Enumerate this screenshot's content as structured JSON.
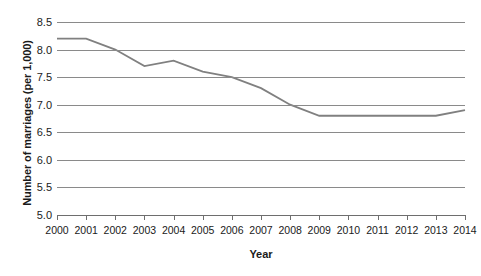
{
  "chart_data": {
    "type": "line",
    "title": "",
    "xlabel": "Year",
    "ylabel": "Number of marriages (per 1,000)",
    "categories": [
      "2000",
      "2001",
      "2002",
      "2003",
      "2004",
      "2005",
      "2006",
      "2007",
      "2008",
      "2009",
      "2010",
      "2011",
      "2012",
      "2013",
      "2014"
    ],
    "values": [
      8.2,
      8.2,
      8.0,
      7.7,
      7.8,
      7.6,
      7.5,
      7.3,
      7.0,
      6.8,
      6.8,
      6.8,
      6.8,
      6.8,
      6.9
    ],
    "series": [
      {
        "name": "Number of marriages (per 1,000)",
        "values": [
          8.2,
          8.2,
          8.0,
          7.7,
          7.8,
          7.6,
          7.5,
          7.3,
          7.0,
          6.8,
          6.8,
          6.8,
          6.8,
          6.8,
          6.9
        ]
      }
    ],
    "ylim": [
      5.0,
      8.5
    ],
    "ytick_step": 0.5,
    "ytick_labels": [
      "8.5",
      "8.0",
      "7.5",
      "7.0",
      "6.5",
      "6.0",
      "5.5",
      "5.0"
    ],
    "grid": true,
    "legend": false,
    "legend_position": "none",
    "markers": false,
    "line_color": "#808080",
    "grid_color": "#8a8a8a",
    "axis_color": "#6e6e6e",
    "text_color": "#1a1a1a",
    "background_color": "#ffffff"
  }
}
